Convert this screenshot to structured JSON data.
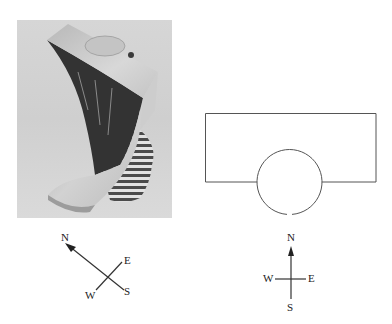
{
  "figure": {
    "photo": {
      "description": "Photograph of a 3D object: a twisted block with a cylindrical peg on top and a striped cylinder base",
      "colors": {
        "background": "#d9d9d9",
        "light_face": "#c8c8c8",
        "dark_face": "#3a3a3a",
        "stripe_dark": "#4a4a4a",
        "stripe_light": "#e6e6e6"
      }
    },
    "left_compass": {
      "labels": {
        "north": "N",
        "east": "E",
        "south": "S",
        "west": "W"
      }
    },
    "top_view": {
      "description": "Top view: rectangle with a circle overlapping its bottom edge"
    },
    "right_compass": {
      "labels": {
        "north": "N",
        "east": "E",
        "south": "S",
        "west": "W"
      }
    },
    "line_color": "#555555"
  }
}
